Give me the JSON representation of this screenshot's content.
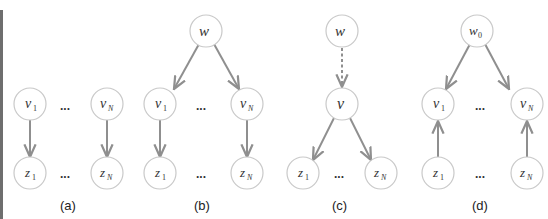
{
  "figure": {
    "colors": {
      "node_stroke": "#c9c9c9",
      "node_fill": "#ffffff",
      "edge": "#8f8f8f",
      "text": "#333333",
      "left_border": "#6e6e6e"
    },
    "panels": [
      {
        "id": "a",
        "label": "(a)",
        "nodes": [
          {
            "id": "v1",
            "base": "v",
            "sub": "1"
          },
          {
            "id": "vN",
            "base": "v",
            "sub": "N"
          },
          {
            "id": "z1",
            "base": "z",
            "sub": "1"
          },
          {
            "id": "zN",
            "base": "z",
            "sub": "N"
          }
        ],
        "edges": [
          {
            "from": "v1",
            "to": "z1",
            "style": "solid"
          },
          {
            "from": "vN",
            "to": "zN",
            "style": "solid"
          }
        ],
        "ellipsis": "..."
      },
      {
        "id": "b",
        "label": "(b)",
        "nodes": [
          {
            "id": "w",
            "base": "w",
            "sub": ""
          },
          {
            "id": "v1",
            "base": "v",
            "sub": "1"
          },
          {
            "id": "vN",
            "base": "v",
            "sub": "N"
          },
          {
            "id": "z1",
            "base": "z",
            "sub": "1"
          },
          {
            "id": "zN",
            "base": "z",
            "sub": "N"
          }
        ],
        "edges": [
          {
            "from": "w",
            "to": "v1",
            "style": "solid"
          },
          {
            "from": "w",
            "to": "vN",
            "style": "solid"
          },
          {
            "from": "v1",
            "to": "z1",
            "style": "solid"
          },
          {
            "from": "vN",
            "to": "zN",
            "style": "solid"
          }
        ],
        "ellipsis": "..."
      },
      {
        "id": "c",
        "label": "(c)",
        "nodes": [
          {
            "id": "w",
            "base": "w",
            "sub": ""
          },
          {
            "id": "v",
            "base": "v",
            "sub": ""
          },
          {
            "id": "z1",
            "base": "z",
            "sub": "1"
          },
          {
            "id": "zN",
            "base": "z",
            "sub": "N"
          }
        ],
        "edges": [
          {
            "from": "w",
            "to": "v",
            "style": "dashed"
          },
          {
            "from": "v",
            "to": "z1",
            "style": "solid"
          },
          {
            "from": "v",
            "to": "zN",
            "style": "solid"
          }
        ],
        "ellipsis": "..."
      },
      {
        "id": "d",
        "label": "(d)",
        "nodes": [
          {
            "id": "w0",
            "base": "w",
            "sub": "0"
          },
          {
            "id": "v1",
            "base": "v",
            "sub": "1"
          },
          {
            "id": "vN",
            "base": "v",
            "sub": "N"
          },
          {
            "id": "z1",
            "base": "z",
            "sub": "1"
          },
          {
            "id": "zN",
            "base": "z",
            "sub": "N"
          }
        ],
        "edges": [
          {
            "from": "w0",
            "to": "v1",
            "style": "solid"
          },
          {
            "from": "w0",
            "to": "vN",
            "style": "solid"
          },
          {
            "from": "z1",
            "to": "v1",
            "style": "solid"
          },
          {
            "from": "zN",
            "to": "vN",
            "style": "solid"
          }
        ],
        "ellipsis": "..."
      }
    ]
  }
}
